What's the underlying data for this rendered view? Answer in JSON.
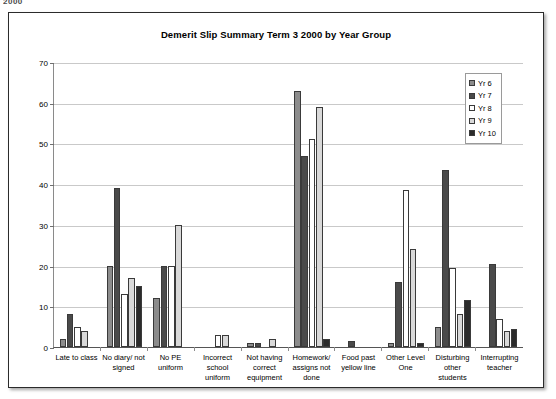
{
  "scan": {
    "top_partial_text": "2000"
  },
  "chart_data": {
    "type": "bar",
    "title": "Demerit Slip Summary Term 3 2000  by Year Group",
    "xlabel": "",
    "ylabel": "",
    "ylim": [
      0,
      70
    ],
    "yticks": [
      0,
      10,
      20,
      30,
      40,
      50,
      60,
      70
    ],
    "grid": true,
    "legend_position": "top-right",
    "categories": [
      "Late to class",
      "No diary/ not signed",
      "No PE uniform",
      "Incorrect school uniform",
      "Not having correct equipment",
      "Homework/ assigns not done",
      "Food past yellow line",
      "Other Level One",
      "Disturbing other students",
      "Interrupting teacher"
    ],
    "series": [
      {
        "name": "Yr 6",
        "color": "#8c8c8c",
        "values": [
          2,
          20,
          12,
          0,
          1,
          63,
          0,
          1,
          5,
          0
        ]
      },
      {
        "name": "Yr 7",
        "color": "#4a4a4a",
        "values": [
          8,
          39,
          20,
          0,
          1,
          47,
          1.5,
          16,
          43.5,
          20.5
        ]
      },
      {
        "name": "Yr 8",
        "color": "#ffffff",
        "values": [
          5,
          13,
          20,
          3,
          0,
          51,
          0,
          38.5,
          19.5,
          7
        ]
      },
      {
        "name": "Yr 9",
        "color": "#d9d9d9",
        "values": [
          4,
          17,
          30,
          3,
          2,
          59,
          0,
          24,
          8,
          4
        ]
      },
      {
        "name": "Yr 10",
        "color": "#2b2b2b",
        "values": [
          0,
          15,
          0,
          0,
          0,
          2,
          0,
          1,
          11.5,
          4.5
        ]
      }
    ]
  }
}
